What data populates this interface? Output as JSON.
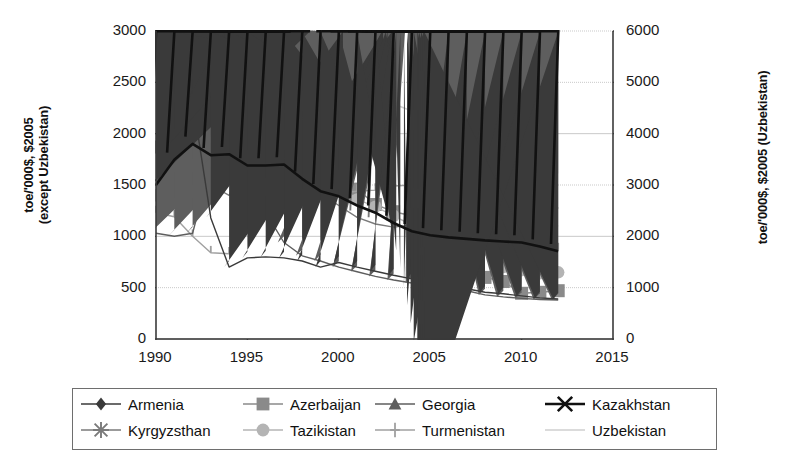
{
  "axes": {
    "left_title": "toe/'000$, $2005\n(except Uzbekistan)",
    "left_title_line1": "toe/'000$, $2005",
    "left_title_line2": "(except Uzbekistan)",
    "right_title": "toe/'000$, $2005 (Uzbekistan)",
    "y_left_ticks": [
      "0",
      "500",
      "1000",
      "1500",
      "2000",
      "2500",
      "3000"
    ],
    "y_right_ticks": [
      "0",
      "1000",
      "2000",
      "3000",
      "4000",
      "5000",
      "6000"
    ],
    "x_ticks": [
      "1990",
      "1995",
      "2000",
      "2005",
      "2010",
      "2015"
    ]
  },
  "legend": {
    "rows": [
      [
        {
          "name": "Armenia",
          "marker": "diamond",
          "color": "#3a3a3a"
        },
        {
          "name": "Azerbaijan",
          "marker": "square",
          "color": "#8a8a8a"
        },
        {
          "name": "Georgia",
          "marker": "triangle",
          "color": "#5e5e5e"
        },
        {
          "name": "Kazakhstan",
          "marker": "x",
          "color": "#111111"
        }
      ],
      [
        {
          "name": "Kyrgyzsthan",
          "marker": "asterisk",
          "color": "#7a7a7a"
        },
        {
          "name": "Tazikistan",
          "marker": "circle",
          "color": "#b4b4b4"
        },
        {
          "name": "Turmenistan",
          "marker": "plus",
          "color": "#a0a0a0"
        },
        {
          "name": "Uzbekistan",
          "marker": "line",
          "color": "#cfcfcf"
        }
      ]
    ]
  },
  "chart_data": {
    "type": "line",
    "title": "",
    "xlabel": "",
    "ylabel": "toe/'000$, $2005 (except Uzbekistan)",
    "ylabel_right": "toe/'000$, $2005 (Uzbekistan)",
    "xlim": [
      1990,
      2015
    ],
    "ylim": [
      0,
      3000
    ],
    "ylim_right": [
      0,
      6000
    ],
    "grid": true,
    "legend_position": "bottom",
    "x": [
      1990,
      1991,
      1992,
      1993,
      1994,
      1995,
      1996,
      1997,
      1998,
      1999,
      2000,
      2001,
      2002,
      2003,
      2004,
      2005,
      2006,
      2007,
      2008,
      2009,
      2010,
      2011,
      2012
    ],
    "series": [
      {
        "name": "Armenia",
        "marker": "diamond",
        "color": "#3a3a3a",
        "axis": "left",
        "values": [
          1500,
          1900,
          2330,
          1180,
          700,
          790,
          800,
          790,
          760,
          700,
          745,
          700,
          660,
          620,
          585,
          555,
          520,
          490,
          455,
          440,
          420,
          400,
          390
        ]
      },
      {
        "name": "Azerbaijan",
        "marker": "square",
        "color": "#8a8a8a",
        "axis": "left",
        "values": [
          1870,
          1880,
          2200,
          2600,
          2620,
          2750,
          2250,
          2100,
          1930,
          1700,
          1620,
          1460,
          1310,
          1240,
          1200,
          1160,
          1110,
          725,
          600,
          560,
          445,
          455,
          470
        ]
      },
      {
        "name": "Georgia",
        "marker": "triangle",
        "color": "#5e5e5e",
        "axis": "left",
        "values": [
          1030,
          1000,
          1030,
          1710,
          2050,
          1620,
          1230,
          940,
          810,
          760,
          700,
          655,
          610,
          575,
          545,
          520,
          495,
          470,
          430,
          410,
          395,
          385,
          380
        ]
      },
      {
        "name": "Kazakhstan",
        "marker": "x",
        "color": "#111111",
        "axis": "left",
        "values": [
          1500,
          1745,
          1900,
          1790,
          1800,
          1690,
          1690,
          1700,
          1560,
          1440,
          1390,
          1300,
          1230,
          1130,
          1050,
          1010,
          990,
          975,
          960,
          950,
          940,
          900,
          855
        ]
      },
      {
        "name": "Kyrgyzsthan",
        "marker": "asterisk",
        "color": "#7a7a7a",
        "axis": "left",
        "values": [
          2450,
          2440,
          1880,
          1500,
          1400,
          1740,
          1610,
          1450,
          1470,
          1420,
          1300,
          1185,
          1120,
          1090,
          1110,
          1060,
          1025,
          1070,
          1050,
          1045,
          1020,
          1120,
          1280
        ]
      },
      {
        "name": "Tazikistan",
        "marker": "circle",
        "color": "#b4b4b4",
        "axis": "left",
        "values": [
          1400,
          1400,
          1690,
          1525,
          1570,
          1780,
          1790,
          1790,
          1770,
          1760,
          1500,
          1360,
          1290,
          1200,
          1110,
          1080,
          1060,
          1030,
          870,
          700,
          670,
          640,
          650
        ]
      },
      {
        "name": "Turmenistan",
        "marker": "plus",
        "color": "#a0a0a0",
        "axis": "left",
        "values": [
          1230,
          1190,
          1000,
          840,
          830,
          1120,
          1260,
          1310,
          1410,
          1400,
          1420,
          1440,
          1450,
          1490,
          1500,
          1480,
          1400,
          1390,
          1370,
          1310,
          1180,
          1040,
          870
        ]
      },
      {
        "name": "Uzbekistan",
        "marker": "line",
        "color": "#cfcfcf",
        "axis": "right",
        "values": [
          3900,
          4250,
          4620,
          4900,
          4780,
          5000,
          4850,
          4850,
          5000,
          4980,
          4840,
          4700,
          4580,
          4580,
          4440,
          4230,
          3850,
          3580,
          3140,
          2850,
          2500,
          2260,
          2200
        ]
      }
    ]
  }
}
